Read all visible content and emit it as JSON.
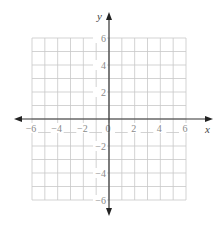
{
  "diagram": {
    "type": "coordinate-plane",
    "x_axis": {
      "label": "x",
      "min": -6,
      "max": 6,
      "grid_step": 1,
      "tick_labels": [
        "-6",
        "-4",
        "-2",
        "0",
        "2",
        "4",
        "6"
      ]
    },
    "y_axis": {
      "label": "y",
      "min": -6,
      "max": 6,
      "grid_step": 1,
      "tick_labels": [
        "6",
        "4",
        "2",
        "-2",
        "-4",
        "-6"
      ]
    },
    "colors": {
      "grid": "#c8c8c8",
      "axis": "#333333",
      "labels": "#8a8a8a",
      "background": "#ffffff"
    }
  }
}
